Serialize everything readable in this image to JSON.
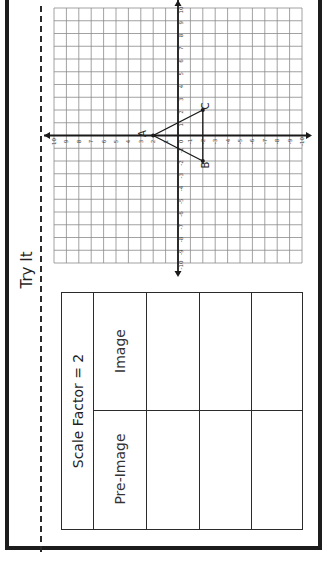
{
  "page": {
    "orientation": "rotated 90 degrees counter-clockwise",
    "section_title": "Try It"
  },
  "table": {
    "title": "Scale Factor = 2",
    "columns": [
      "Pre-Image",
      "Image"
    ],
    "rows": [
      {
        "pre_image": "",
        "image": ""
      },
      {
        "pre_image": "",
        "image": ""
      },
      {
        "pre_image": "",
        "image": ""
      }
    ]
  },
  "coordinate_plane": {
    "x_range": [
      -10,
      10
    ],
    "y_range": [
      -10,
      10
    ],
    "tick_labels_positive": [
      "1",
      "2",
      "3",
      "4",
      "5",
      "6",
      "7",
      "8",
      "9",
      "10"
    ],
    "tick_labels_negative": [
      "-1",
      "-2",
      "-3",
      "-4",
      "-5",
      "-6",
      "-7",
      "-8",
      "-9",
      "-10"
    ],
    "origin_label": "0",
    "triangle": {
      "points": [
        {
          "label": "A",
          "x": 0,
          "y": 2
        },
        {
          "label": "B",
          "x": -2,
          "y": -2
        },
        {
          "label": "C",
          "x": 2,
          "y": -2
        }
      ]
    }
  },
  "colors": {
    "border": "#1c1c1c",
    "grid_line": "#8a8a8a",
    "axis": "#1a1a1a",
    "background": "#ffffff"
  }
}
